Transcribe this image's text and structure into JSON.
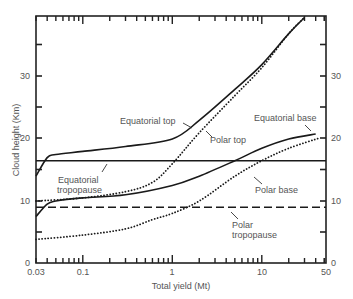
{
  "chart_data": {
    "type": "line",
    "title": "",
    "xlabel": "Total yield (Mt)",
    "ylabel": "Cloud height (Km)",
    "xscale": "log",
    "xlim": [
      0.03,
      50
    ],
    "ylim": [
      0,
      40
    ],
    "x_tick_labels": [
      "0.03",
      "0.1",
      "1",
      "10",
      "50"
    ],
    "y_tick_labels": [
      "0",
      "10",
      "20",
      "30"
    ],
    "y_right_tick_labels": [
      "0",
      "10",
      "20",
      "30"
    ],
    "grid": false,
    "legend": "none (inline annotations)",
    "series": [
      {
        "name": "Equatorial top",
        "style": "solid",
        "x": [
          0.03,
          0.04,
          0.05,
          0.1,
          0.3,
          1,
          2,
          5,
          10,
          20,
          30
        ],
        "y": [
          14,
          17,
          17.5,
          18,
          18.8,
          20,
          23,
          28,
          32,
          37,
          39.6
        ]
      },
      {
        "name": "Polar top",
        "style": "dotted",
        "x": [
          0.03,
          0.1,
          0.3,
          0.6,
          1,
          2,
          5,
          10,
          20,
          30
        ],
        "y": [
          10,
          10.5,
          11.5,
          13,
          16,
          21,
          27,
          31.5,
          37,
          39.6
        ]
      },
      {
        "name": "Equatorial base",
        "style": "solid",
        "x": [
          0.03,
          0.04,
          0.05,
          0.1,
          0.3,
          1,
          2,
          5,
          10,
          20,
          40
        ],
        "y": [
          7.5,
          9.5,
          10,
          10.5,
          11,
          12.5,
          14,
          16.5,
          18.5,
          20,
          20.8
        ]
      },
      {
        "name": "Polar base",
        "style": "dotted",
        "x": [
          0.03,
          0.1,
          0.3,
          0.6,
          1,
          2,
          5,
          10,
          20,
          45
        ],
        "y": [
          3.8,
          4.5,
          5.5,
          7,
          8,
          10,
          14,
          16.5,
          18.5,
          20.2
        ]
      },
      {
        "name": "Equatorial tropopause",
        "style": "solid",
        "x": [
          0.03,
          50
        ],
        "y": [
          16.5,
          16.5
        ]
      },
      {
        "name": "Polar tropopause",
        "style": "dashed",
        "x": [
          0.03,
          50
        ],
        "y": [
          9,
          9
        ]
      }
    ],
    "annotations": [
      {
        "text": "Equatorial top",
        "x": 0.45,
        "y": 22.5
      },
      {
        "text": "Polar top",
        "x": 2.5,
        "y": 19.8
      },
      {
        "text": "Equatorial base",
        "x": 10,
        "y": 22.5
      },
      {
        "text": "Equatorial tropopause",
        "x": 0.05,
        "y": 13.5
      },
      {
        "text": "Polar base",
        "x": 4,
        "y": 12.3
      },
      {
        "text": "Polar tropopause",
        "x": 1,
        "y": 4.5
      }
    ]
  },
  "labels": {
    "xlabel": "Total yield (Mt)",
    "ylabel": "Cloud height (Km)",
    "eq_top": "Equatorial top",
    "polar_top": "Polar top",
    "eq_base": "Equatorial base",
    "eq_trop_1": "Equatorial",
    "eq_trop_2": "tropopause",
    "polar_base": "Polar base",
    "polar_trop_1": "Polar",
    "polar_trop_2": "tropopause",
    "x0": "0.03",
    "x1": "0.1",
    "x2": "1",
    "x3": "10",
    "x4": "50",
    "y0": "0",
    "y10": "10",
    "y20": "20",
    "y30": "30"
  }
}
